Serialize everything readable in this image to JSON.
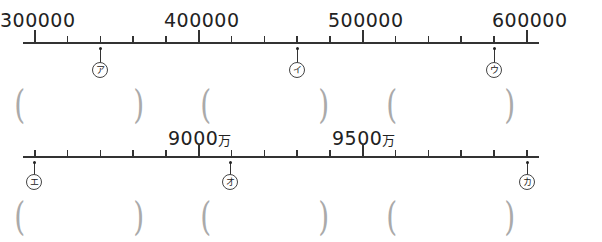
{
  "number_line_1": {
    "labels": [
      "300000",
      "400000",
      "500000",
      "600000"
    ],
    "markers": [
      "ア",
      "イ",
      "ウ"
    ]
  },
  "number_line_2": {
    "labels": [
      {
        "num": "9000",
        "unit": "万"
      },
      {
        "num": "9500",
        "unit": "万"
      }
    ],
    "markers": [
      "エ",
      "オ",
      "カ"
    ]
  },
  "answer_brackets": {
    "open": "(",
    "close": ")"
  },
  "chart_data": [
    {
      "type": "number_line",
      "title": "",
      "min_tick": 300000,
      "tick_interval": 20000,
      "ticks": [
        300000,
        320000,
        340000,
        360000,
        380000,
        400000,
        420000,
        440000,
        460000,
        480000,
        500000,
        520000,
        540000,
        560000,
        580000,
        600000
      ],
      "labeled_ticks": [
        300000,
        400000,
        500000,
        600000
      ],
      "points": [
        {
          "name": "ア",
          "value": 340000
        },
        {
          "name": "イ",
          "value": 460000
        },
        {
          "name": "ウ",
          "value": 580000
        }
      ]
    },
    {
      "type": "number_line",
      "title": "",
      "unit": "万",
      "tick_interval": 100,
      "ticks": [
        8500,
        8600,
        8700,
        8800,
        8900,
        9000,
        9100,
        9200,
        9300,
        9400,
        9500,
        9600,
        9700,
        9800,
        9900,
        10000
      ],
      "labeled_ticks": [
        9000,
        9500
      ],
      "points": [
        {
          "name": "エ",
          "value": 8500
        },
        {
          "name": "オ",
          "value": 9100
        },
        {
          "name": "カ",
          "value": 10000
        }
      ]
    }
  ]
}
